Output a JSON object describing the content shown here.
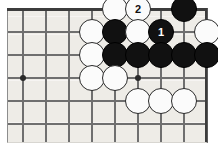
{
  "diagram": {
    "kind": "go-board-diagram",
    "title": "",
    "board": {
      "cols": 9,
      "rows": 6,
      "line_color": "#6f6f6f",
      "board_color": "#eeece7",
      "frame_color": "#4a4a4a",
      "x_positions": [
        23,
        46,
        69,
        92,
        115,
        138,
        161,
        184,
        207
      ],
      "y_positions": [
        9,
        32,
        55,
        78,
        101,
        124
      ],
      "edge_top_y": 9,
      "edge_right_x": 207
    },
    "star_points": [
      {
        "name": "star-point-left",
        "x": 23,
        "y": 78
      },
      {
        "name": "star-point-right",
        "x": 138,
        "y": 78
      }
    ],
    "stones": [
      {
        "id": "w-a",
        "color": "white",
        "x": 115,
        "y": 9,
        "label": ""
      },
      {
        "id": "w-2",
        "color": "white",
        "x": 138,
        "y": 9,
        "label": "2"
      },
      {
        "id": "b-a",
        "color": "black",
        "x": 184,
        "y": 9,
        "label": ""
      },
      {
        "id": "w-b",
        "color": "white",
        "x": 92,
        "y": 32,
        "label": ""
      },
      {
        "id": "b-b",
        "color": "black",
        "x": 115,
        "y": 32,
        "label": ""
      },
      {
        "id": "w-c",
        "color": "white",
        "x": 138,
        "y": 32,
        "label": ""
      },
      {
        "id": "b-1",
        "color": "black",
        "x": 161,
        "y": 32,
        "label": "1"
      },
      {
        "id": "w-d",
        "color": "white",
        "x": 207,
        "y": 32,
        "label": ""
      },
      {
        "id": "w-e",
        "color": "white",
        "x": 92,
        "y": 55,
        "label": ""
      },
      {
        "id": "b-c",
        "color": "black",
        "x": 115,
        "y": 55,
        "label": ""
      },
      {
        "id": "b-d",
        "color": "black",
        "x": 138,
        "y": 55,
        "label": ""
      },
      {
        "id": "b-e",
        "color": "black",
        "x": 161,
        "y": 55,
        "label": ""
      },
      {
        "id": "b-f",
        "color": "black",
        "x": 184,
        "y": 55,
        "label": ""
      },
      {
        "id": "b-g",
        "color": "black",
        "x": 207,
        "y": 55,
        "label": ""
      },
      {
        "id": "w-f",
        "color": "white",
        "x": 92,
        "y": 78,
        "label": ""
      },
      {
        "id": "w-g",
        "color": "white",
        "x": 115,
        "y": 78,
        "label": ""
      },
      {
        "id": "w-h",
        "color": "white",
        "x": 138,
        "y": 101,
        "label": ""
      },
      {
        "id": "w-i",
        "color": "white",
        "x": 161,
        "y": 101,
        "label": ""
      },
      {
        "id": "w-j",
        "color": "white",
        "x": 184,
        "y": 101,
        "label": ""
      }
    ],
    "move_numbers": [
      {
        "number": "1",
        "color": "black"
      },
      {
        "number": "2",
        "color": "white"
      }
    ]
  }
}
